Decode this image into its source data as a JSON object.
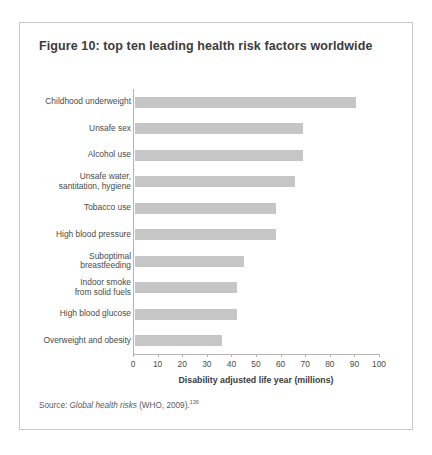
{
  "page": {
    "top_cut_text": "                                                                          "
  },
  "figure": {
    "title": "Figure 10: top ten leading health risk factors worldwide",
    "source_prefix": "Source: ",
    "source_italic": "Global health risks",
    "source_suffix": " (WHO, 2009).",
    "source_superscript": "136"
  },
  "chart_data": {
    "type": "bar",
    "orientation": "horizontal",
    "title": "Figure 10: top ten leading health risk factors worldwide",
    "categories": [
      "Childhood underweight",
      "Unsafe sex",
      "Alcohol use",
      "Unsafe water,\nsantitation, hygiene",
      "Tobacco use",
      "High blood pressure",
      "Suboptimal\nbreastfeeding",
      "Indoor smoke\nfrom solid fuels",
      "High blood glucose",
      "Overweight and obesity"
    ],
    "values": [
      91,
      69,
      69,
      66,
      58,
      58,
      45,
      42,
      42,
      36
    ],
    "xlabel": "Disability adjusted life year (millions)",
    "ylabel": "",
    "xlim": [
      0,
      100
    ],
    "xticks": [
      0,
      10,
      20,
      30,
      40,
      50,
      60,
      70,
      80,
      90,
      100
    ],
    "xticklabels": [
      "0",
      "10",
      "20",
      "30",
      "40",
      "50",
      "60",
      "70",
      "80",
      "90",
      "100"
    ],
    "grid": false,
    "legend": false,
    "bar_color": "#c6c6c6"
  }
}
